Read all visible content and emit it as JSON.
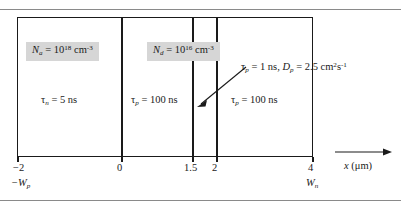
{
  "figure": {
    "type": "semiconductor-device-diagram"
  },
  "regions": [
    {
      "name": "p-region",
      "doping_label": "N_a = 10^18 cm^-3",
      "doping_symbol": "N",
      "doping_subscript": "a",
      "doping_value": "10",
      "doping_exponent": "18",
      "doping_units": "cm",
      "doping_units_exponent": "-3",
      "lifetime_symbol": "τ",
      "lifetime_subscript": "n",
      "lifetime_value": "= 5 ns",
      "x_start": -2,
      "x_end": 0
    },
    {
      "name": "n-region-near",
      "doping_label": "N_d = 10^16 cm^-3",
      "doping_symbol": "N",
      "doping_subscript": "d",
      "doping_value": "10",
      "doping_exponent": "16",
      "doping_units": "cm",
      "doping_units_exponent": "-3",
      "lifetime_symbol": "τ",
      "lifetime_subscript": "p",
      "lifetime_value": "= 100 ns",
      "x_start": 0,
      "x_end": 1.5
    },
    {
      "name": "n-region-thin-strip",
      "lifetime_symbol": "τ",
      "lifetime_subscript": "p",
      "x_start": 1.5,
      "x_end": 2
    },
    {
      "name": "n-region-far",
      "lifetime_symbol": "τ",
      "lifetime_subscript": "p",
      "lifetime_value": "= 100 ns",
      "x_start": 2,
      "x_end": 4
    }
  ],
  "callout": {
    "tau_symbol": "τ",
    "tau_subscript": "p",
    "tau_value": "= 1 ns,",
    "d_symbol": "D",
    "d_subscript": "p",
    "d_value": "= 2.5 cm",
    "d_units_exp": "2",
    "d_units_tail": "s",
    "d_units_tail_exp": "-1"
  },
  "axis": {
    "label_var": "x",
    "label_units": "(μm)",
    "ticks": [
      {
        "value": "−2",
        "sub_symbol": "−W",
        "sub_subscript": "p"
      },
      {
        "value": "0",
        "sub_symbol": "",
        "sub_subscript": ""
      },
      {
        "value": "1.5",
        "sub_symbol": "",
        "sub_subscript": ""
      },
      {
        "value": "2",
        "sub_symbol": "",
        "sub_subscript": ""
      },
      {
        "value": "4",
        "sub_symbol": "W",
        "sub_subscript": "n"
      }
    ]
  },
  "colors": {
    "line": "#1a1a1a",
    "highlight": "#d6d6d6",
    "rule": "#8a8a8a",
    "background": "#ffffff"
  }
}
